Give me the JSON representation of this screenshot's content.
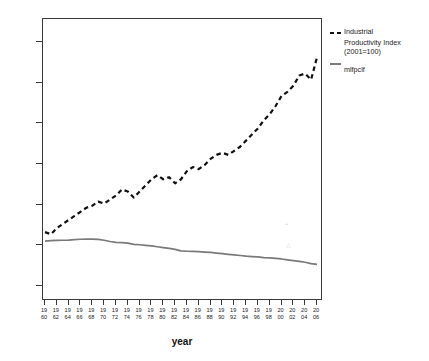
{
  "chart_data": {
    "type": "line",
    "title": "",
    "xlabel": "year",
    "ylabel": "",
    "ylim": [
      0,
      120
    ],
    "xlim": [
      1960,
      2006
    ],
    "grid": false,
    "legend_position": "right",
    "y_ticks": [
      0,
      20,
      40,
      60,
      80,
      100,
      120
    ],
    "x_tick_labels": [
      [
        "19",
        "60"
      ],
      [
        "19",
        "62"
      ],
      [
        "19",
        "64"
      ],
      [
        "19",
        "66"
      ],
      [
        "19",
        "68"
      ],
      [
        "19",
        "70"
      ],
      [
        "19",
        "72"
      ],
      [
        "19",
        "74"
      ],
      [
        "19",
        "76"
      ],
      [
        "19",
        "78"
      ],
      [
        "19",
        "80"
      ],
      [
        "19",
        "82"
      ],
      [
        "19",
        "84"
      ],
      [
        "19",
        "86"
      ],
      [
        "19",
        "88"
      ],
      [
        "19",
        "90"
      ],
      [
        "19",
        "92"
      ],
      [
        "19",
        "94"
      ],
      [
        "19",
        "96"
      ],
      [
        "19",
        "98"
      ],
      [
        "20",
        "00"
      ],
      [
        "20",
        "02"
      ],
      [
        "20",
        "04"
      ],
      [
        "20",
        "06"
      ]
    ],
    "x": [
      1960,
      1961,
      1962,
      1963,
      1964,
      1965,
      1966,
      1967,
      1968,
      1969,
      1970,
      1971,
      1972,
      1973,
      1974,
      1975,
      1976,
      1977,
      1978,
      1979,
      1980,
      1981,
      1982,
      1983,
      1984,
      1985,
      1986,
      1987,
      1988,
      1989,
      1990,
      1991,
      1992,
      1993,
      1994,
      1995,
      1996,
      1997,
      1998,
      1999,
      2000,
      2001,
      2002,
      2003,
      2004,
      2005,
      2006
    ],
    "series": [
      {
        "name": "Industrial Productivity Index (2001=100)",
        "style": "dashed",
        "color": "#111111",
        "values": [
          26,
          25,
          28,
          30,
          32,
          34,
          36,
          38,
          39,
          41,
          40,
          42,
          44,
          47,
          46,
          43,
          46,
          49,
          52,
          54,
          52,
          53,
          50,
          52,
          56,
          58,
          57,
          59,
          62,
          64,
          65,
          64,
          66,
          68,
          71,
          74,
          77,
          81,
          84,
          88,
          93,
          95,
          98,
          103,
          104,
          101,
          112
        ]
      },
      {
        "name": "mlfpclf",
        "style": "solid",
        "color": "#7a7a7a",
        "values": [
          21.6,
          21.8,
          21.9,
          22.0,
          22.1,
          22.3,
          22.5,
          22.6,
          22.6,
          22.4,
          22.0,
          21.4,
          21.0,
          20.8,
          20.6,
          20.0,
          19.8,
          19.5,
          19.2,
          18.8,
          18.4,
          18.0,
          17.5,
          16.8,
          16.6,
          16.5,
          16.4,
          16.2,
          16.0,
          15.7,
          15.4,
          15.1,
          14.8,
          14.5,
          14.2,
          14.0,
          13.8,
          13.5,
          13.3,
          13.1,
          12.8,
          12.4,
          12.0,
          11.6,
          11.2,
          10.5,
          10.1
        ]
      }
    ]
  },
  "legend": {
    "items": [
      {
        "line1": "Industrial",
        "line2": "Productivity Index",
        "line3": "(2001=100)",
        "marker": "dashed-line-marker"
      },
      {
        "line1": "mlfpclf",
        "line2": "",
        "line3": "",
        "marker": "solid-line-marker"
      }
    ]
  },
  "axes": {
    "x_title": "year"
  }
}
